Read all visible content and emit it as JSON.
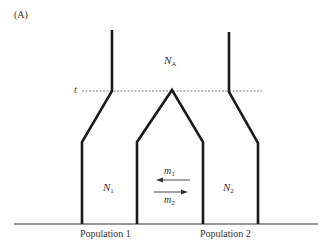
{
  "panel_label": "(A)",
  "time_label": "t",
  "ancestral_pop": {
    "symbol": "N",
    "subscript": "A"
  },
  "pop1": {
    "symbol": "N",
    "subscript": "1",
    "name": "Population 1"
  },
  "pop2": {
    "symbol": "N",
    "subscript": "2",
    "name": "Population 2"
  },
  "migration": {
    "m1": {
      "symbol": "m",
      "subscript": "1",
      "direction": "left"
    },
    "m2": {
      "symbol": "m",
      "subscript": "2",
      "direction": "right"
    }
  },
  "colors": {
    "line": "#1a1a1a",
    "dotted": "#555555",
    "text": "#333333"
  }
}
